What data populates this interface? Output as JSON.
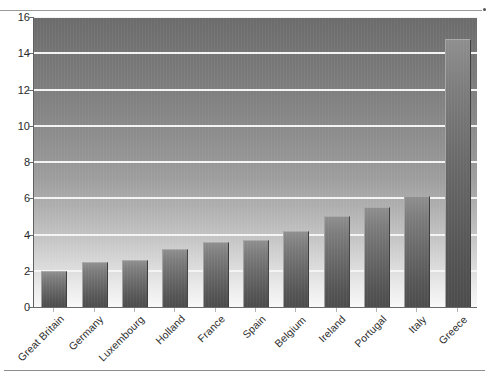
{
  "chart_data": {
    "type": "bar",
    "title": "",
    "xlabel": "",
    "ylabel": "",
    "categories": [
      "Great Britain",
      "Germany",
      "Luxembourg",
      "Holland",
      "France",
      "Spain",
      "Belgium",
      "Ireland",
      "Portugal",
      "Italy",
      "Greece"
    ],
    "values": [
      2.0,
      2.5,
      2.6,
      3.2,
      3.6,
      3.7,
      4.2,
      5.0,
      5.5,
      6.1,
      14.8
    ],
    "ylim": [
      0,
      16
    ],
    "ytick_values": [
      0,
      2,
      4,
      6,
      8,
      10,
      12,
      14,
      16
    ],
    "ytick_labels": [
      "0",
      "2",
      "4",
      "6",
      "8",
      "10",
      "12",
      "14",
      "16"
    ],
    "grid": true,
    "gridline_color": "#f4f4f4",
    "legend": null,
    "legend_position": "none",
    "bar_color_top": "#8e8e8e",
    "bar_color_bottom": "#4c4c4c",
    "plot_background_top": "#6b6b6b",
    "plot_background_bottom": "#f8f8f8",
    "axis_color": "#6a6a6a",
    "label_color": "#2b2b2b",
    "xtick_label_rotation": -45
  }
}
